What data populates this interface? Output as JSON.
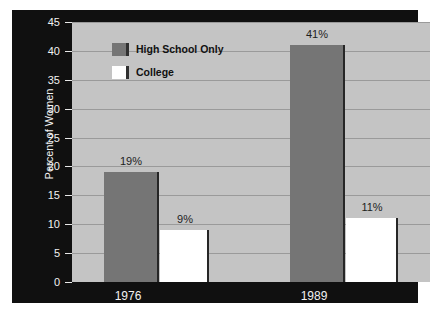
{
  "chart_data": {
    "type": "bar",
    "title": "",
    "subtitle": "",
    "xlabel": "",
    "ylabel": "Percent of Women",
    "categories": [
      "1976",
      "1989"
    ],
    "series": [
      {
        "name": "High School Only",
        "color": "#757575",
        "values": [
          19,
          41
        ],
        "labels": [
          "19%",
          "41%"
        ]
      },
      {
        "name": "College",
        "color": "#ffffff",
        "values": [
          9,
          11
        ],
        "labels": [
          "9%",
          "11%"
        ]
      }
    ],
    "ylim": [
      0,
      45
    ],
    "ytick_values": [
      0,
      5,
      10,
      15,
      20,
      25,
      30,
      35,
      40,
      45
    ],
    "ytick_labels": [
      "0",
      "5",
      "10",
      "15",
      "20",
      "25",
      "30",
      "35",
      "40",
      "45"
    ],
    "grid": true,
    "legend_position": "upper-left-inside",
    "colors": {
      "panel_background": "#101010",
      "plot_background": "#c4c4c4",
      "gridline": "#9a9a9a",
      "axis_text": "#f2f2f2",
      "label_text": "#1d1d1d",
      "high_school_bar": "#757575",
      "college_bar": "#ffffff",
      "bar_shadow": "#262626"
    }
  },
  "legend": {
    "items": [
      {
        "label": "High School Only",
        "swatch": "high-school-swatch"
      },
      {
        "label": "College",
        "swatch": "college-swatch"
      }
    ]
  },
  "axes": {
    "y_title": "Percent of Women",
    "y_ticks": [
      "45",
      "40",
      "35",
      "30",
      "25",
      "20",
      "15",
      "10",
      "5",
      "0"
    ],
    "x_ticks": [
      "1976",
      "1989"
    ]
  },
  "bar_labels": {
    "g1_hs": "19%",
    "g1_col": "9%",
    "g2_hs": "41%",
    "g2_col": "11%"
  }
}
